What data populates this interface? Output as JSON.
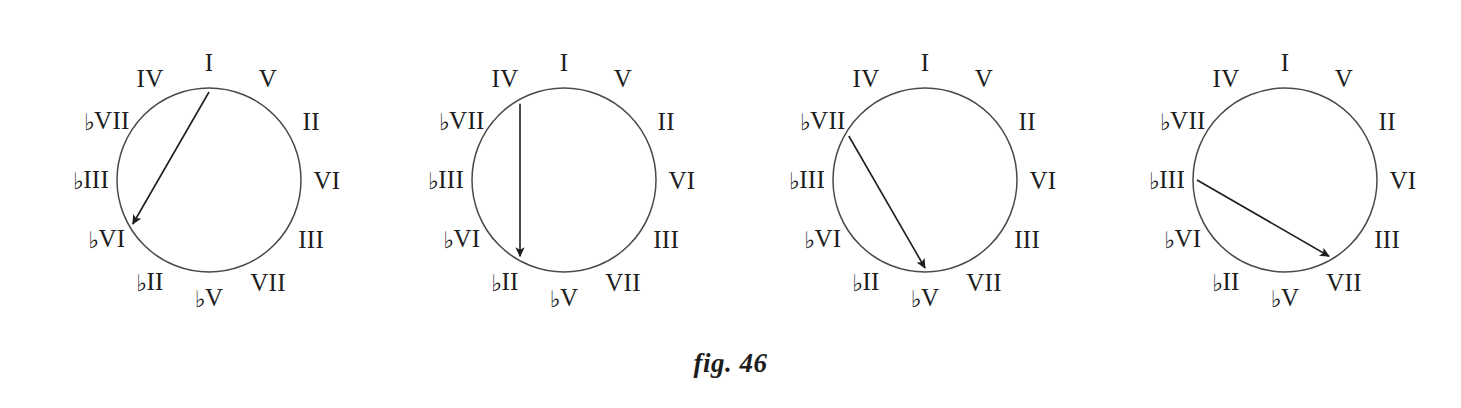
{
  "figure": {
    "caption": "fig. 46",
    "background_color": "#ffffff",
    "ink_color": "#1d1d1d",
    "circle_stroke_color": "#4a4a4a"
  },
  "wheel": {
    "description": "Circle-of-fifths clock face with twelve Roman-numeral scale degrees",
    "positions": [
      {
        "hour": 0,
        "angle_deg": 0,
        "label": "I",
        "flat": false,
        "numeral": "I"
      },
      {
        "hour": 1,
        "angle_deg": 30,
        "label": "V",
        "flat": false,
        "numeral": "V"
      },
      {
        "hour": 2,
        "angle_deg": 60,
        "label": "II",
        "flat": false,
        "numeral": "II"
      },
      {
        "hour": 3,
        "angle_deg": 90,
        "label": "VI",
        "flat": false,
        "numeral": "VI"
      },
      {
        "hour": 4,
        "angle_deg": 120,
        "label": "III",
        "flat": false,
        "numeral": "III"
      },
      {
        "hour": 5,
        "angle_deg": 150,
        "label": "VII",
        "flat": false,
        "numeral": "VII"
      },
      {
        "hour": 6,
        "angle_deg": 180,
        "label": "♭V",
        "flat": true,
        "numeral": "V"
      },
      {
        "hour": 7,
        "angle_deg": 210,
        "label": "♭II",
        "flat": true,
        "numeral": "II"
      },
      {
        "hour": 8,
        "angle_deg": 240,
        "label": "♭VI",
        "flat": true,
        "numeral": "VI"
      },
      {
        "hour": 9,
        "angle_deg": 270,
        "label": "♭III",
        "flat": true,
        "numeral": "III"
      },
      {
        "hour": 10,
        "angle_deg": 300,
        "label": "♭VII",
        "flat": true,
        "numeral": "VII"
      },
      {
        "hour": 11,
        "angle_deg": 330,
        "label": "IV",
        "flat": false,
        "numeral": "IV"
      }
    ]
  },
  "diagrams": [
    {
      "index": 1,
      "name": "tritone-I-to-flat-VI",
      "arrow_from_label": "I",
      "arrow_to_label": "♭VI",
      "arrow_from_hour": 0,
      "arrow_to_hour": 8
    },
    {
      "index": 2,
      "name": "tritone-IV-to-flat-II",
      "arrow_from_label": "IV",
      "arrow_to_label": "♭II",
      "arrow_from_hour": 11,
      "arrow_to_hour": 7
    },
    {
      "index": 3,
      "name": "tritone-flat-VII-to-flat-V",
      "arrow_from_label": "♭VII",
      "arrow_to_label": "♭V",
      "arrow_from_hour": 10,
      "arrow_to_hour": 6
    },
    {
      "index": 4,
      "name": "tritone-flat-III-to-VII",
      "arrow_from_label": "♭III",
      "arrow_to_label": "VII",
      "arrow_from_hour": 9,
      "arrow_to_hour": 5
    }
  ]
}
